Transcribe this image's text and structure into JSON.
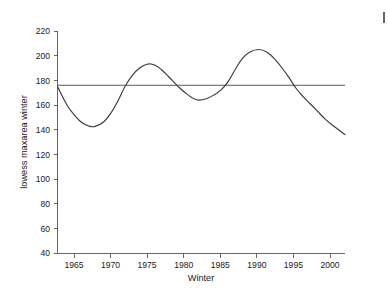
{
  "chart_data": {
    "type": "line",
    "title": "",
    "subtitle": "",
    "xlabel": "Winter",
    "ylabel": "lowess maxarea winter",
    "xlim": [
      1962.7,
      2002.3
    ],
    "ylim": [
      40,
      220
    ],
    "xticks": [
      1965,
      1970,
      1975,
      1980,
      1985,
      1990,
      1995,
      2000
    ],
    "xticklabels": [
      "1965",
      "1970",
      "1975",
      "1980",
      "1985",
      "1990",
      "1995",
      "2000"
    ],
    "yticks": [
      40,
      60,
      80,
      100,
      120,
      140,
      160,
      180,
      200,
      220
    ],
    "yticklabels": [
      "40",
      "60",
      "80",
      "100",
      "120",
      "140",
      "160",
      "180",
      "200",
      "220"
    ],
    "grid": false,
    "legend": "none",
    "series": [
      {
        "name": "lowess maxarea winter",
        "type": "line",
        "color": "#3a3a3a",
        "x": [
          1962.7,
          1964.0,
          1965.0,
          1966.0,
          1967.0,
          1967.8,
          1969.0,
          1970.0,
          1971.0,
          1972.0,
          1973.0,
          1974.0,
          1975.0,
          1975.6,
          1976.5,
          1977.5,
          1978.5,
          1979.5,
          1980.5,
          1981.5,
          1982.2,
          1983.2,
          1984.2,
          1985.2,
          1986.2,
          1987.2,
          1988.2,
          1989.2,
          1990.4,
          1991.5,
          1992.5,
          1993.5,
          1994.5,
          1995.5,
          1996.5,
          1997.5,
          1998.5,
          1999.5,
          2000.5,
          2002.3
        ],
        "y": [
          175,
          160,
          152,
          146,
          143,
          142.5,
          146,
          153,
          163,
          175,
          184,
          190,
          193,
          193.2,
          191,
          186,
          180,
          174,
          169,
          165,
          164,
          165,
          168,
          172,
          179,
          189,
          198,
          203,
          205,
          203,
          198,
          191,
          183,
          174,
          167,
          161,
          155,
          149,
          144,
          136
        ]
      },
      {
        "name": "reference-line",
        "type": "hline",
        "color": "#5a5a5a",
        "y_value": 176,
        "x_start": 1962.7,
        "x_end": 2002.3
      }
    ],
    "annotations": []
  },
  "axes": {
    "y_axis_name": "y-axis",
    "x_axis_name": "x-axis"
  }
}
